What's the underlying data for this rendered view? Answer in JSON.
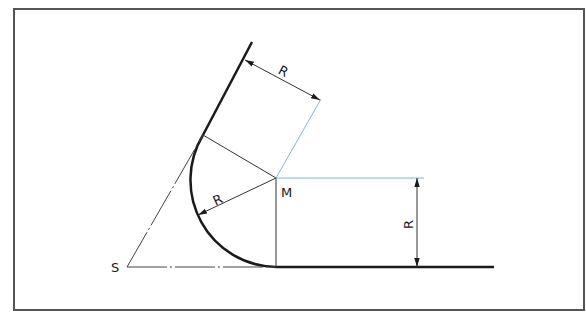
{
  "diagram": {
    "labels": {
      "radius_top": "R",
      "radius_arc": "R",
      "radius_vertical": "R",
      "center": "M",
      "vertex": "S"
    },
    "colors": {
      "frame": "#555555",
      "contour": "#1a1a1a",
      "thin": "#333333",
      "construction_blue": "#7ab8e0"
    },
    "geometry": {
      "frame": {
        "x": 14,
        "y": 9,
        "w": 570,
        "h": 301
      },
      "center_M": [
        276,
        178
      ],
      "radius_px": 89,
      "vertex_S": [
        127,
        267
      ],
      "slanted_line_top": [
        252,
        42
      ],
      "arc_start_tangent": [
        203,
        135
      ],
      "arc_end_tangent": [
        276,
        267
      ],
      "baseline_end": [
        494,
        267
      ]
    }
  }
}
